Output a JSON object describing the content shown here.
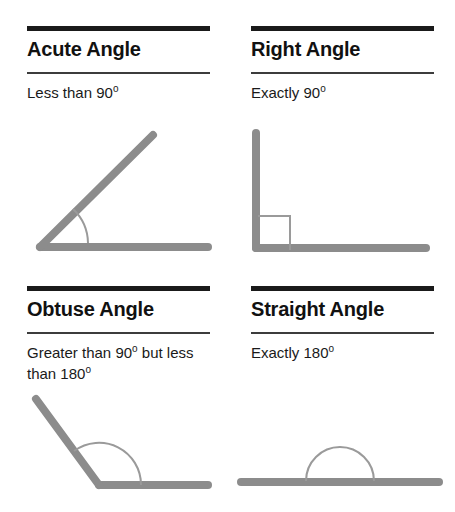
{
  "page": {
    "background_color": "#ffffff",
    "rule_color": "#1a1a1a",
    "ray_color": "#8c8c8c",
    "arc_color": "#8c8c8c",
    "text_color": "#111111"
  },
  "cards": [
    {
      "id": "acute-angle",
      "heading": "Acute Angle",
      "description_lines": [
        "Less than 90"
      ],
      "degree_symbol": "o",
      "description_suffix": "",
      "figure": {
        "kind": "acute",
        "measure_text": "Less than 90 degrees",
        "vertex": [
          40,
          247
        ],
        "rays": [
          [
            208,
            247
          ],
          [
            153,
            135
          ]
        ],
        "marker": "arc"
      }
    },
    {
      "id": "right-angle",
      "heading": "Right Angle",
      "description_lines": [
        "Exactly 90"
      ],
      "degree_symbol": "o",
      "description_suffix": "",
      "figure": {
        "kind": "right",
        "measure_text": "Exactly 90 degrees",
        "vertex": [
          28,
          248
        ],
        "rays": [
          [
            198,
            248
          ],
          [
            28,
            133
          ]
        ],
        "marker": "square"
      }
    },
    {
      "id": "obtuse-angle",
      "heading": "Obtuse Angle",
      "description_lines": [
        "Greater than 90",
        "less than 180"
      ],
      "degree_symbol": "o",
      "description_suffix": " but",
      "figure": {
        "kind": "obtuse",
        "measure_text": "Greater than 90 degrees but less than 180 degrees",
        "vertex": [
          99,
          225
        ],
        "rays": [
          [
            208,
            225
          ],
          [
            36,
            139
          ]
        ],
        "marker": "arc"
      }
    },
    {
      "id": "straight-angle",
      "heading": "Straight Angle",
      "description_lines": [
        "Exactly 180"
      ],
      "degree_symbol": "o",
      "description_suffix": "",
      "figure": {
        "kind": "straight",
        "measure_text": "Exactly 180 degrees",
        "vertex": [
          112,
          222
        ],
        "rays": [
          [
            13,
            222
          ],
          [
            211,
            222
          ]
        ],
        "marker": "semicircle"
      }
    }
  ]
}
